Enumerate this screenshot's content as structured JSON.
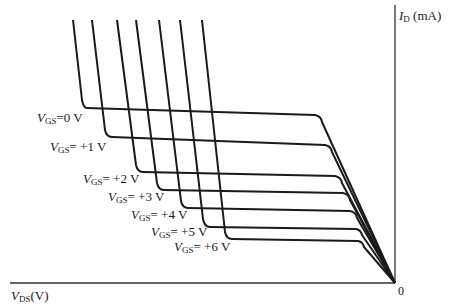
{
  "chart_data": {
    "type": "line",
    "title": "",
    "xlabel": "V_DS(V)",
    "ylabel": "I_D (mA)",
    "origin_label": "0",
    "axes": {
      "x_direction": "increasing to the left (negative V_DS)",
      "y_direction": "increasing upward",
      "grid": false,
      "ticks": false
    },
    "legend": "inline labels at curve knees",
    "series": [
      {
        "name": "V_GS=0 V",
        "label_main": "V",
        "label_sub": "GS",
        "label_rest": "=0 V",
        "points": [
          [
            73,
            20
          ],
          [
            82,
            100
          ],
          [
            87,
            108
          ],
          [
            315,
            115
          ],
          [
            322,
            122
          ],
          [
            395,
            283
          ]
        ]
      },
      {
        "name": "V_GS=+1 V",
        "label_main": "V",
        "label_sub": "GS",
        "label_rest": "= +1 V",
        "points": [
          [
            92,
            20
          ],
          [
            105,
            130
          ],
          [
            112,
            137
          ],
          [
            325,
            145
          ],
          [
            332,
            152
          ],
          [
            395,
            283
          ]
        ]
      },
      {
        "name": "V_GS=+2 V",
        "label_main": "V",
        "label_sub": "GS",
        "label_rest": "= +2 V",
        "points": [
          [
            117,
            20
          ],
          [
            136,
            165
          ],
          [
            143,
            172
          ],
          [
            335,
            176
          ],
          [
            342,
            183
          ],
          [
            395,
            283
          ]
        ]
      },
      {
        "name": "V_GS=+3 V",
        "label_main": "V",
        "label_sub": "GS",
        "label_rest": "= +3 V",
        "points": [
          [
            136,
            20
          ],
          [
            157,
            183
          ],
          [
            164,
            190
          ],
          [
            343,
            193
          ],
          [
            350,
            200
          ],
          [
            395,
            283
          ]
        ]
      },
      {
        "name": "V_GS=+4 V",
        "label_main": "V",
        "label_sub": "GS",
        "label_rest": "= +4 V",
        "points": [
          [
            159,
            20
          ],
          [
            181,
            201
          ],
          [
            188,
            208
          ],
          [
            350,
            211
          ],
          [
            357,
            218
          ],
          [
            395,
            283
          ]
        ]
      },
      {
        "name": "V_GS=+5 V",
        "label_main": "V",
        "label_sub": "GS",
        "label_rest": "= +5 V",
        "points": [
          [
            180,
            20
          ],
          [
            203,
            219
          ],
          [
            210,
            227
          ],
          [
            356,
            229
          ],
          [
            362,
            235
          ],
          [
            395,
            283
          ]
        ]
      },
      {
        "name": "V_GS=+6 V",
        "label_main": "V",
        "label_sub": "GS",
        "label_rest": "= +6 V",
        "points": [
          [
            202,
            20
          ],
          [
            225,
            232
          ],
          [
            232,
            239
          ],
          [
            358,
            241
          ],
          [
            364,
            247
          ],
          [
            395,
            283
          ]
        ]
      }
    ],
    "note": "Qualitative JFET/MOSFET output characteristic (p-channel style, mirrored); points are pixel coordinates since axes carry no numeric ticks."
  },
  "labels": {
    "y_axis_main": "I",
    "y_axis_sub": "D",
    "y_axis_unit": " (mA)",
    "x_axis_main": "V",
    "x_axis_sub": "DS",
    "x_axis_unit": "(V)",
    "origin": "0"
  },
  "colors": {
    "curve": "#1a1a1a",
    "axis": "#333333",
    "background": "#ffffff"
  }
}
